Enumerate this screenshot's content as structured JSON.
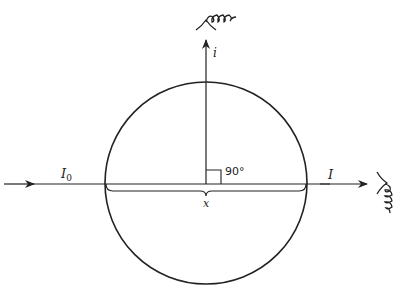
{
  "diagram": {
    "type": "scattering geometry",
    "labels": {
      "incident_intensity": "I",
      "incident_subscript": "0",
      "transmitted_intensity": "I",
      "scattered_intensity": "i",
      "angle": "90°",
      "path_length": "x"
    },
    "elements": [
      "incident beam arrow",
      "transmitted beam arrow",
      "scattered beam arrow (upward)",
      "circular sample",
      "right-angle marker",
      "brace spanning diameter",
      "detector coil top",
      "detector coil right"
    ],
    "stroke_color": "#222222"
  }
}
